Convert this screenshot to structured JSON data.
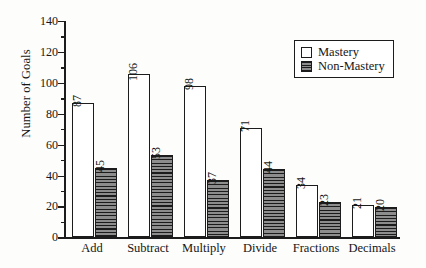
{
  "chart_data": {
    "type": "bar",
    "title": "",
    "subtitle": "",
    "xlabel": "",
    "ylabel": "Number of Goals",
    "categories": [
      "Add",
      "Subtract",
      "Multiply",
      "Divide",
      "Fractions",
      "Decimals"
    ],
    "series": [
      {
        "name": "Mastery",
        "values": [
          87,
          106,
          98,
          71,
          34,
          21
        ],
        "fill": "white",
        "pattern": "solid-white",
        "color": "#ffffff"
      },
      {
        "name": "Non-Mastery",
        "values": [
          45,
          53,
          37,
          44,
          23,
          20
        ],
        "fill": "gray",
        "pattern": "horizontal-hatch",
        "color": "#8d8d8d"
      }
    ],
    "ylim": [
      0,
      140
    ],
    "y_major_ticks": [
      0,
      20,
      40,
      60,
      80,
      100,
      120,
      140
    ],
    "y_minor_ticks": [
      10,
      30,
      50,
      70,
      90,
      110,
      130
    ],
    "y_tick_labels": [
      "0",
      "20",
      "40",
      "60",
      "80",
      "100",
      "120",
      "140"
    ],
    "grid": false,
    "legend_position": "top-right",
    "value_labels_shown": true,
    "value_label_rotation_deg": -90,
    "axis_color": "#1c1c1c",
    "background_color": "#fdfdfc"
  },
  "legend": {
    "entries": [
      {
        "label": "Mastery",
        "swatch": "legend-swatch-mastery"
      },
      {
        "label": "Non-Mastery",
        "swatch": "legend-swatch-nonmastery"
      }
    ]
  }
}
